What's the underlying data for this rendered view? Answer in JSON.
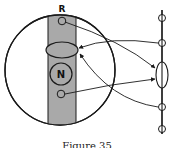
{
  "diagram": {
    "labels": {
      "band_label": "R",
      "nucleus_label": "N"
    },
    "caption": "Figure 35",
    "colors": {
      "stroke": "#1a1a1a",
      "band_fill": "#a9a9a9",
      "background": "#ffffff"
    },
    "elements": {
      "cell_circle": {
        "cx": 60,
        "cy": 70,
        "r": 55
      },
      "band": {
        "x": 48,
        "y": 14,
        "width": 28,
        "height": 115
      },
      "band_small_circle_top": {
        "cx": 62,
        "cy": 21,
        "r": 4
      },
      "band_ellipse": {
        "cx": 62,
        "cy": 50,
        "rx": 16,
        "ry": 8
      },
      "nucleus": {
        "cx": 61,
        "cy": 74,
        "r": 11
      },
      "band_small_circle_bottom": {
        "cx": 61,
        "cy": 94,
        "r": 4
      },
      "axis_line": {
        "x": 162,
        "y1": 10,
        "y2": 132
      },
      "axis_circles_y": [
        18,
        43,
        107,
        129
      ],
      "axis_ellipse": {
        "cx": 162,
        "cy": 75,
        "rx": 6,
        "ry": 13
      }
    }
  }
}
